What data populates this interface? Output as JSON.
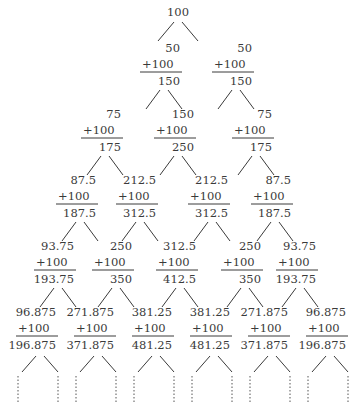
{
  "diagram": {
    "root": {
      "label": "100",
      "x": 178,
      "y": 16
    },
    "levels": [
      {
        "y": 52,
        "nodes": [
          {
            "x": 164,
            "top": "50",
            "add": "+100",
            "sum": "150"
          },
          {
            "x": 236,
            "top": "50",
            "add": "+100",
            "sum": "150"
          }
        ]
      },
      {
        "y": 118,
        "nodes": [
          {
            "x": 105,
            "top": "75",
            "add": "+100",
            "sum": "175"
          },
          {
            "x": 178,
            "top": "150",
            "add": "+100",
            "sum": "250"
          },
          {
            "x": 256,
            "top": "75",
            "add": "+100",
            "sum": "175"
          }
        ]
      },
      {
        "y": 184,
        "nodes": [
          {
            "x": 80,
            "top": "87.5",
            "add": "+100",
            "sum": "187.5"
          },
          {
            "x": 140,
            "top": "212.5",
            "add": "+100",
            "sum": "312.5"
          },
          {
            "x": 212,
            "top": "212.5",
            "add": "+100",
            "sum": "312.5"
          },
          {
            "x": 275,
            "top": "87.5",
            "add": "+100",
            "sum": "187.5"
          }
        ]
      },
      {
        "y": 250,
        "nodes": [
          {
            "x": 58,
            "top": "93.75",
            "add": "+100",
            "sum": "193.75"
          },
          {
            "x": 116,
            "top": "250",
            "add": "+100",
            "sum": "350"
          },
          {
            "x": 180,
            "top": "312.5",
            "add": "+100",
            "sum": "412.5"
          },
          {
            "x": 245,
            "top": "250",
            "add": "+100",
            "sum": "350"
          },
          {
            "x": 300,
            "top": "93.75",
            "add": "+100",
            "sum": "193.75"
          }
        ]
      },
      {
        "y": 316,
        "nodes": [
          {
            "x": 40,
            "top": "96.875",
            "add": "+100",
            "sum": "196.875"
          },
          {
            "x": 98,
            "top": "271.875",
            "add": "+100",
            "sum": "371.875"
          },
          {
            "x": 156,
            "top": "381.25",
            "add": "+100",
            "sum": "481.25"
          },
          {
            "x": 214,
            "top": "381.25",
            "add": "+100",
            "sum": "481.25"
          },
          {
            "x": 272,
            "top": "271.875",
            "add": "+100",
            "sum": "371.875"
          },
          {
            "x": 330,
            "top": "96.875",
            "add": "+100",
            "sum": "196.875"
          }
        ]
      }
    ],
    "continuation": "ellipsis-dotted"
  }
}
